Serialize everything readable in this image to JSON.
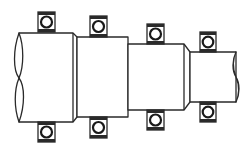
{
  "diagram": {
    "colors": {
      "stroke": "#2a2a2a",
      "background": "#ffffff"
    },
    "shaft": {
      "segments": [
        {
          "name": "segment-1",
          "x1": 19,
          "x2": 73,
          "top": 33,
          "bottom": 122
        },
        {
          "name": "segment-2",
          "x1": 77,
          "x2": 128,
          "top": 37,
          "bottom": 117
        },
        {
          "name": "segment-3",
          "x1": 128,
          "x2": 184,
          "top": 44,
          "bottom": 110
        },
        {
          "name": "segment-4",
          "x1": 190,
          "x2": 236,
          "top": 52,
          "bottom": 102
        }
      ],
      "left_end": "break-line",
      "right_end": "break-line"
    },
    "bearings": [
      {
        "name": "bearing-1",
        "x": 38,
        "top_y": 12,
        "bottom_y": 122
      },
      {
        "name": "bearing-2",
        "x": 90,
        "top_y": 16,
        "bottom_y": 117
      },
      {
        "name": "bearing-3",
        "x": 147,
        "top_y": 24,
        "bottom_y": 110
      },
      {
        "name": "bearing-4",
        "x": 200,
        "top_y": 32,
        "bottom_y": 102
      }
    ],
    "bearing_size": {
      "w": 17,
      "h": 20
    }
  }
}
